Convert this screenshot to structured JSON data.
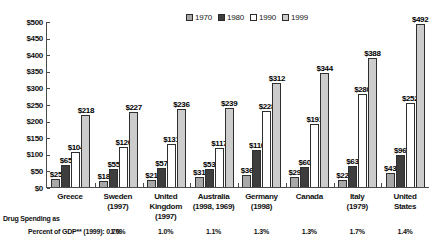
{
  "chart_data": {
    "type": "bar",
    "title": "",
    "xlabel": "",
    "ylabel": "",
    "ylim": [
      0,
      500
    ],
    "ytick_labels": [
      "$500",
      "$450",
      "$400",
      "$350",
      "$300",
      "$250",
      "$200",
      "$150",
      "$100",
      "$50",
      "$0"
    ],
    "ytick_values": [
      500,
      450,
      400,
      350,
      300,
      250,
      200,
      150,
      100,
      50,
      0
    ],
    "grid": false,
    "legend_position": "top-right",
    "categories": [
      "Greece",
      "Sweden (1997)",
      "United Kingdom (1997)",
      "Australia (1998, 1969)",
      "Germany (1998)",
      "Canada",
      "Italy (1979)",
      "United States"
    ],
    "series": [
      {
        "name": "1970",
        "color": "#a8a8a8",
        "values": [
          25,
          18,
          21,
          31,
          36,
          29,
          22,
          43
        ]
      },
      {
        "name": "1980",
        "color": "#3d3d3d",
        "values": [
          65,
          55,
          57,
          53,
          110,
          60,
          63,
          96
        ]
      },
      {
        "name": "1990",
        "color": "#ffffff",
        "values": [
          104,
          120,
          131,
          117,
          228,
          191,
          280,
          252
        ]
      },
      {
        "name": "1999",
        "color": "#cccccc",
        "values": [
          218,
          227,
          236,
          239,
          312,
          344,
          388,
          492
        ]
      }
    ],
    "value_labels": [
      [
        "$25",
        "$65",
        "$104",
        "$218"
      ],
      [
        "$18",
        "$55",
        "$120",
        "$227"
      ],
      [
        "$21",
        "$57",
        "$131",
        "$236"
      ],
      [
        "$31",
        "$53",
        "$117",
        "$239"
      ],
      [
        "$36",
        "$110",
        "$228",
        "$312"
      ],
      [
        "$29",
        "$60",
        "$191",
        "$344"
      ],
      [
        "$22",
        "$63",
        "$280",
        "$388"
      ],
      [
        "$43",
        "$96",
        "$252",
        "$492"
      ]
    ],
    "annotations": {
      "footnote_label": "Drug Spending as Percent of GDP** (1999):",
      "gdp_percent": [
        "0.7%",
        "1.0%",
        "1.0%",
        "1.1%",
        "1.3%",
        "1.3%",
        "1.7%",
        "1.4%"
      ]
    }
  },
  "legend": {
    "items": [
      {
        "label": "1970",
        "color": "#a8a8a8"
      },
      {
        "label": "1980",
        "color": "#3d3d3d"
      },
      {
        "label": "1990",
        "color": "#ffffff"
      },
      {
        "label": "1999",
        "color": "#cccccc"
      }
    ]
  },
  "xaxis": {
    "labels": [
      "Greece",
      "Sweden\n(1997)",
      "United\nKingdom\n(1997)",
      "Australia\n(1998, 1969)",
      "Germany\n(1998)",
      "Canada",
      "Italy\n(1979)",
      "United\nStates"
    ]
  },
  "footnote": {
    "line1": "Drug Spending as",
    "line2": "Percent of GDP** (1999): 0.7%"
  }
}
